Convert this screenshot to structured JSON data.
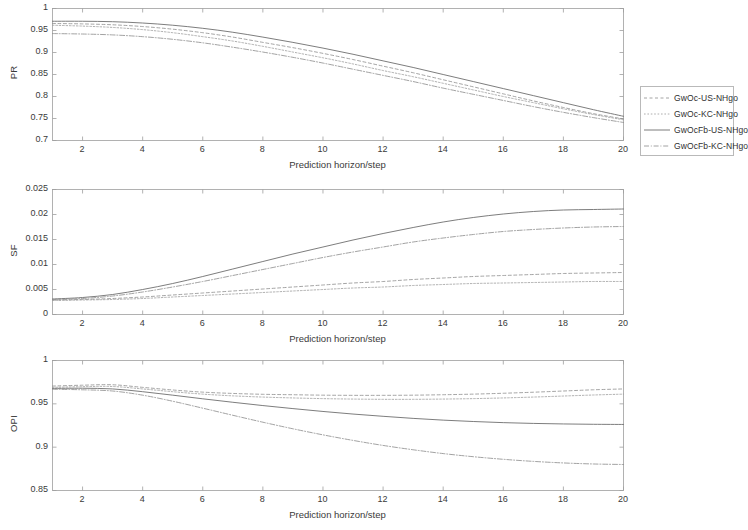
{
  "figure": {
    "width": 737,
    "height": 530,
    "background": "#ffffff"
  },
  "legend": {
    "position": "right-middle-upper",
    "entries": [
      {
        "label": "GwOc-US-NHgo",
        "color": "#6f6f6f",
        "dash": "4 3"
      },
      {
        "label": "GwOc-KC-NHgo",
        "color": "#8a8a8a",
        "dash": "2 2"
      },
      {
        "label": "GwOcFb-US-NHgo",
        "color": "#5a5a5a",
        "dash": "none"
      },
      {
        "label": "GwOcFb-KC-NHgo",
        "color": "#7d7d7d",
        "dash": "6 2 1 2"
      }
    ]
  },
  "chart_data": [
    {
      "type": "line",
      "title": "",
      "xlabel": "Prediction horizon/step",
      "ylabel": "PR",
      "xlim": [
        1,
        20
      ],
      "ylim": [
        0.7,
        1
      ],
      "xticks": [
        2,
        4,
        6,
        8,
        10,
        12,
        14,
        16,
        18,
        20
      ],
      "yticks": [
        0.7,
        0.75,
        0.8,
        0.85,
        0.9,
        0.95,
        1
      ],
      "ytick_labels": [
        "0.7",
        "0.75",
        "0.8",
        "0.85",
        "0.9",
        "0.95",
        "1"
      ],
      "grid": false,
      "x": [
        1,
        2,
        3,
        4,
        5,
        6,
        7,
        8,
        9,
        10,
        11,
        12,
        13,
        14,
        15,
        16,
        17,
        18,
        19,
        20
      ],
      "series": [
        {
          "name": "GwOc-US-NHgo",
          "values": [
            0.966,
            0.965,
            0.963,
            0.959,
            0.953,
            0.945,
            0.935,
            0.923,
            0.911,
            0.898,
            0.884,
            0.869,
            0.854,
            0.838,
            0.822,
            0.806,
            0.79,
            0.775,
            0.761,
            0.749
          ]
        },
        {
          "name": "GwOc-KC-NHgo",
          "values": [
            0.962,
            0.96,
            0.957,
            0.952,
            0.945,
            0.936,
            0.926,
            0.914,
            0.901,
            0.888,
            0.874,
            0.859,
            0.845,
            0.83,
            0.815,
            0.8,
            0.786,
            0.772,
            0.759,
            0.747
          ]
        },
        {
          "name": "GwOcFb-US-NHgo",
          "values": [
            0.971,
            0.971,
            0.97,
            0.967,
            0.962,
            0.955,
            0.946,
            0.935,
            0.923,
            0.91,
            0.896,
            0.881,
            0.866,
            0.85,
            0.834,
            0.818,
            0.802,
            0.786,
            0.77,
            0.755
          ]
        },
        {
          "name": "GwOcFb-KC-NHgo",
          "values": [
            0.943,
            0.942,
            0.94,
            0.936,
            0.93,
            0.922,
            0.912,
            0.901,
            0.889,
            0.876,
            0.862,
            0.848,
            0.834,
            0.819,
            0.805,
            0.791,
            0.777,
            0.764,
            0.752,
            0.741
          ]
        }
      ]
    },
    {
      "type": "line",
      "title": "",
      "xlabel": "Prediction horizon/step",
      "ylabel": "SF",
      "xlim": [
        1,
        20
      ],
      "ylim": [
        0,
        0.025
      ],
      "xticks": [
        2,
        4,
        6,
        8,
        10,
        12,
        14,
        16,
        18,
        20
      ],
      "yticks": [
        0,
        0.005,
        0.01,
        0.015,
        0.02,
        0.025
      ],
      "ytick_labels": [
        "0",
        "0.005",
        "0.01",
        "0.015",
        "0.02",
        "0.025"
      ],
      "grid": false,
      "x": [
        1,
        2,
        3,
        4,
        5,
        6,
        7,
        8,
        9,
        10,
        11,
        12,
        13,
        14,
        15,
        16,
        17,
        18,
        19,
        20
      ],
      "series": [
        {
          "name": "GwOc-US-NHgo",
          "values": [
            0.0029,
            0.003,
            0.0032,
            0.0035,
            0.0039,
            0.0043,
            0.0047,
            0.0051,
            0.0055,
            0.0059,
            0.0063,
            0.0066,
            0.007,
            0.0073,
            0.0076,
            0.0078,
            0.008,
            0.0082,
            0.0083,
            0.0084
          ]
        },
        {
          "name": "GwOc-KC-NHgo",
          "values": [
            0.0028,
            0.0029,
            0.003,
            0.0032,
            0.0035,
            0.0038,
            0.0041,
            0.0044,
            0.0047,
            0.005,
            0.0053,
            0.0055,
            0.0058,
            0.006,
            0.0062,
            0.0063,
            0.0064,
            0.0065,
            0.0066,
            0.0066
          ]
        },
        {
          "name": "GwOcFb-US-NHgo",
          "values": [
            0.0031,
            0.0034,
            0.004,
            0.005,
            0.0062,
            0.0076,
            0.0091,
            0.0106,
            0.0121,
            0.0135,
            0.0149,
            0.0162,
            0.0174,
            0.0185,
            0.0194,
            0.0201,
            0.0206,
            0.0209,
            0.021,
            0.0211
          ]
        },
        {
          "name": "GwOcFb-KC-NHgo",
          "values": [
            0.003,
            0.0032,
            0.0037,
            0.0045,
            0.0055,
            0.0066,
            0.0078,
            0.009,
            0.0102,
            0.0114,
            0.0125,
            0.0135,
            0.0145,
            0.0153,
            0.016,
            0.0166,
            0.017,
            0.0173,
            0.0175,
            0.0176
          ]
        }
      ]
    },
    {
      "type": "line",
      "title": "",
      "xlabel": "Prediction horizon/step",
      "ylabel": "OPI",
      "xlim": [
        1,
        20
      ],
      "ylim": [
        0.85,
        1
      ],
      "xticks": [
        2,
        4,
        6,
        8,
        10,
        12,
        14,
        16,
        18,
        20
      ],
      "yticks": [
        0.85,
        0.9,
        0.95,
        1
      ],
      "ytick_labels": [
        "0.85",
        "0.9",
        "0.95",
        "1"
      ],
      "grid": false,
      "x": [
        1,
        2,
        3,
        4,
        5,
        6,
        7,
        8,
        9,
        10,
        11,
        12,
        13,
        14,
        15,
        16,
        17,
        18,
        19,
        20
      ],
      "series": [
        {
          "name": "GwOc-US-NHgo",
          "values": [
            0.9705,
            0.9715,
            0.972,
            0.969,
            0.966,
            0.9635,
            0.962,
            0.961,
            0.9605,
            0.96,
            0.9598,
            0.9598,
            0.96,
            0.9605,
            0.9612,
            0.9622,
            0.9634,
            0.9648,
            0.9662,
            0.9672
          ]
        },
        {
          "name": "GwOc-KC-NHgo",
          "values": [
            0.969,
            0.9698,
            0.97,
            0.9672,
            0.964,
            0.9612,
            0.9592,
            0.9578,
            0.9568,
            0.956,
            0.9555,
            0.9552,
            0.9552,
            0.9555,
            0.956,
            0.9568,
            0.9578,
            0.959,
            0.9602,
            0.9612
          ]
        },
        {
          "name": "GwOcFb-US-NHgo",
          "values": [
            0.9678,
            0.968,
            0.9672,
            0.964,
            0.96,
            0.9558,
            0.9518,
            0.948,
            0.9445,
            0.9412,
            0.9382,
            0.9356,
            0.9332,
            0.9312,
            0.9296,
            0.9283,
            0.9274,
            0.9268,
            0.9264,
            0.9262
          ]
        },
        {
          "name": "GwOcFb-KC-NHgo",
          "values": [
            0.9668,
            0.9662,
            0.9648,
            0.96,
            0.953,
            0.945,
            0.9368,
            0.9288,
            0.9212,
            0.9142,
            0.9078,
            0.902,
            0.897,
            0.8926,
            0.889,
            0.886,
            0.8836,
            0.8818,
            0.8806,
            0.88
          ]
        }
      ]
    }
  ]
}
